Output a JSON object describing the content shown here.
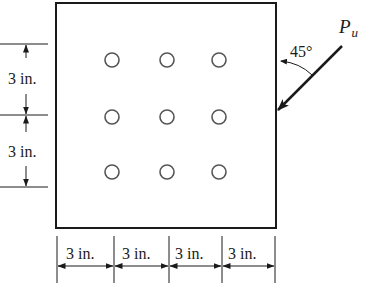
{
  "diagram": {
    "type": "bolted-connection-plate",
    "plate": {
      "x": 56,
      "y": 3,
      "width": 220,
      "height": 225
    },
    "bolt_rows": 3,
    "bolt_cols": 3,
    "bolts": [
      {
        "x": 112,
        "y": 60
      },
      {
        "x": 167,
        "y": 60
      },
      {
        "x": 219,
        "y": 60
      },
      {
        "x": 112,
        "y": 117
      },
      {
        "x": 167,
        "y": 117
      },
      {
        "x": 219,
        "y": 117
      },
      {
        "x": 112,
        "y": 172
      },
      {
        "x": 167,
        "y": 172
      },
      {
        "x": 219,
        "y": 172
      }
    ],
    "bolt_radius": 7,
    "vertical_dimensions": [
      {
        "label": "3 in.",
        "from_y": 44,
        "to_y": 115
      },
      {
        "label": "3 in.",
        "from_y": 115,
        "to_y": 187
      }
    ],
    "horizontal_dimensions": [
      {
        "label": "3 in.",
        "from_x": 57,
        "to_x": 114
      },
      {
        "label": "3 in.",
        "from_x": 114,
        "to_x": 169
      },
      {
        "label": "3 in.",
        "from_x": 169,
        "to_x": 222
      },
      {
        "label": "3 in.",
        "from_x": 222,
        "to_x": 275
      }
    ],
    "load": {
      "symbol": "P",
      "subscript": "u",
      "angle_label": "45°",
      "angle_deg": 45
    },
    "colors": {
      "line": "#1a1a1a",
      "bolt": "#555555",
      "background": "#ffffff"
    }
  }
}
